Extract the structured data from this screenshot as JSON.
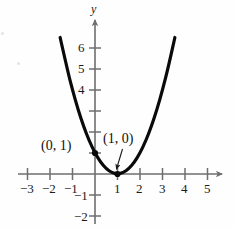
{
  "chart_data": {
    "type": "line",
    "title": "",
    "subtitle": "",
    "xlabel": "",
    "ylabel": "y",
    "x_axis_name": "",
    "y_axis_name": "y",
    "xlim": [
      -3.8,
      5.8
    ],
    "ylim": [
      -2.6,
      7.2
    ],
    "grid": false,
    "legend": null,
    "x_ticks": [
      -3,
      -2,
      -1,
      1,
      2,
      3,
      4,
      5
    ],
    "x_tick_labels": [
      "−3",
      "−2",
      "−1",
      "1",
      "2",
      "3",
      "4",
      "5"
    ],
    "y_ticks": [
      -2,
      -1,
      1,
      2,
      3,
      4,
      5,
      6
    ],
    "y_tick_labels_shown": {
      "-2": "−2",
      "-1": "−1",
      "4": "4",
      "5": "5",
      "6": "6"
    },
    "series": [
      {
        "name": "y = (x - 1)^2",
        "type": "parabola",
        "equation": "y = (x − 1)²",
        "vertex": [
          1,
          0
        ],
        "x_domain": [
          -1.55,
          3.55
        ],
        "color": "#0a0a0a",
        "linewidth": 3.2,
        "points": [
          [
            -1.55,
            6.5
          ],
          [
            -1.2,
            4.84
          ],
          [
            -1.0,
            4.0
          ],
          [
            -0.75,
            3.06
          ],
          [
            -0.5,
            2.25
          ],
          [
            -0.25,
            1.56
          ],
          [
            0,
            1
          ],
          [
            0.25,
            0.5625
          ],
          [
            0.5,
            0.25
          ],
          [
            0.75,
            0.0625
          ],
          [
            1,
            0
          ],
          [
            1.25,
            0.0625
          ],
          [
            1.5,
            0.25
          ],
          [
            1.75,
            0.5625
          ],
          [
            2,
            1
          ],
          [
            2.25,
            1.5625
          ],
          [
            2.5,
            2.25
          ],
          [
            2.75,
            3.06
          ],
          [
            3,
            4.0
          ],
          [
            3.25,
            5.06
          ],
          [
            3.55,
            6.5
          ]
        ]
      }
    ],
    "annotations": [
      {
        "name": "y-intercept",
        "label": "(0, 1)",
        "point": [
          0,
          1
        ],
        "marker": "filled-dot",
        "label_position": "left"
      },
      {
        "name": "vertex",
        "label": "(1, 0)",
        "point": [
          1,
          0
        ],
        "marker": "filled-dot",
        "label_position": "above",
        "leader_line": true
      }
    ],
    "axis_color": "#6e6e6e",
    "axis_arrows": [
      "x-positive",
      "y-positive"
    ]
  },
  "labels": {
    "y_axis_name": "y",
    "x_neg3": "−3",
    "x_neg2": "−2",
    "x_neg1": "−1",
    "x_1": "1",
    "x_2": "2",
    "x_3": "3",
    "x_4": "4",
    "x_5": "5",
    "y_6": "6",
    "y_5": "5",
    "y_4": "4",
    "y_neg1": "−1",
    "y_neg2": "−2",
    "annot_y_intercept": "(0, 1)",
    "annot_vertex": "(1, 0)"
  }
}
